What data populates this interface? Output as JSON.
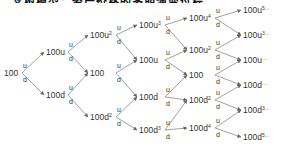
{
  "title": "二叉树模型：资产价格的多期演变过程",
  "edge_labels": {
    "up": "u",
    "down": "d"
  },
  "columns": [
    [
      {
        "base": "100",
        "exp": ""
      }
    ],
    [
      {
        "base": "100u",
        "exp": ""
      },
      {
        "base": "100d",
        "exp": ""
      }
    ],
    [
      {
        "base": "100u",
        "exp": "2"
      },
      {
        "base": "100",
        "exp": ""
      },
      {
        "base": "100d",
        "exp": "2"
      }
    ],
    [
      {
        "base": "100u",
        "exp": "3"
      },
      {
        "base": "100u",
        "exp": ""
      },
      {
        "base": "100d",
        "exp": ""
      },
      {
        "base": "100d",
        "exp": "3"
      }
    ],
    [
      {
        "base": "100u",
        "exp": "4"
      },
      {
        "base": "100u",
        "exp": "2"
      },
      {
        "base": "100",
        "exp": ""
      },
      {
        "base": "100d",
        "exp": "2"
      },
      {
        "base": "100d",
        "exp": "4"
      }
    ],
    [
      {
        "base": "100u",
        "exp": "5…"
      },
      {
        "base": "100u",
        "exp": "3…"
      },
      {
        "base": "100u",
        "exp": "…"
      },
      {
        "base": "100d",
        "exp": "…"
      },
      {
        "base": "100d",
        "exp": "3…"
      },
      {
        "base": "100d",
        "exp": "5…"
      }
    ]
  ],
  "colors": {
    "line": "#888888",
    "text": "#333333"
  }
}
